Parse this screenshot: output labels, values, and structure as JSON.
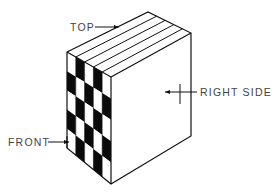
{
  "diagram": {
    "type": "isometric-block",
    "colors": {
      "line": "#111111",
      "fill_dark": "#0a0a0a",
      "fill_light": "#ffffff",
      "label": "#444444"
    },
    "geometry": {
      "front_top_left": [
        67,
        52
      ],
      "front_top_right": [
        111,
        77
      ],
      "front_bottom_left": [
        67,
        148
      ],
      "front_bottom_right": [
        111,
        184
      ],
      "back_top_left": [
        148,
        12
      ],
      "right_top_right": [
        191,
        33
      ],
      "right_bottom_right": [
        191,
        136
      ]
    },
    "front_grid": {
      "columns": 5,
      "rows": 5,
      "first_cell_dark": false
    },
    "top_layers": 5,
    "labels": [
      {
        "id": "top",
        "text": "TOP",
        "x": 70,
        "y": 31,
        "arrow_from": [
          95,
          27
        ],
        "arrow_to": [
          119,
          27
        ]
      },
      {
        "id": "right-side",
        "text": "RIGHT SIDE",
        "x": 200,
        "y": 96,
        "arrow_from": [
          197,
          92
        ],
        "arrow_to": [
          165,
          92
        ]
      },
      {
        "id": "front",
        "text": "FRONT",
        "x": 8,
        "y": 146,
        "arrow_from": [
          48,
          142
        ],
        "arrow_to": [
          69,
          142
        ]
      }
    ]
  }
}
